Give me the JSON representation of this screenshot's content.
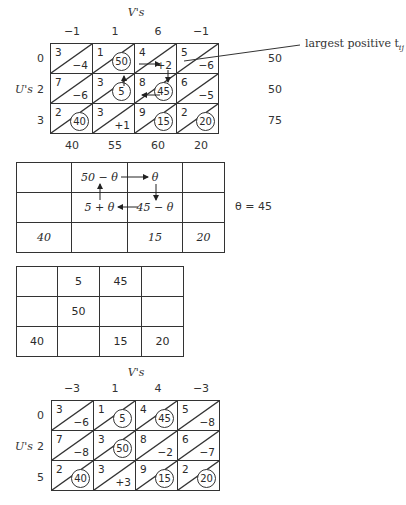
{
  "tableau1": {
    "v_label": "V's",
    "u_label": "U's",
    "v_values": [
      "−1",
      "1",
      "6",
      "−1"
    ],
    "u_values": [
      "0",
      "2",
      "3"
    ],
    "supply": [
      "50",
      "50",
      "75"
    ],
    "demand": [
      "40",
      "55",
      "60",
      "20"
    ],
    "cells": [
      [
        {
          "cost": "3",
          "val": "−4",
          "alloc": false
        },
        {
          "cost": "1",
          "val": "50",
          "alloc": true
        },
        {
          "cost": "4",
          "val": "+2",
          "alloc": false
        },
        {
          "cost": "5",
          "val": "−6",
          "alloc": false
        }
      ],
      [
        {
          "cost": "7",
          "val": "−6",
          "alloc": false
        },
        {
          "cost": "3",
          "val": "5",
          "alloc": true
        },
        {
          "cost": "8",
          "val": "45",
          "alloc": true
        },
        {
          "cost": "6",
          "val": "−5",
          "alloc": false
        }
      ],
      [
        {
          "cost": "2",
          "val": "40",
          "alloc": true
        },
        {
          "cost": "3",
          "val": "+1",
          "alloc": false
        },
        {
          "cost": "9",
          "val": "15",
          "alloc": true
        },
        {
          "cost": "2",
          "val": "20",
          "alloc": true
        }
      ]
    ],
    "annotation": "largest positive t",
    "annotation_sub": "ij"
  },
  "loop_table": {
    "cells": [
      [
        "",
        "50 − θ",
        "θ",
        ""
      ],
      [
        "",
        "5 + θ",
        "45 − θ",
        ""
      ],
      [
        "40",
        "",
        "15",
        "20"
      ]
    ],
    "theta_note": "θ = 45"
  },
  "new_allocation": {
    "cells": [
      [
        "",
        "5",
        "45",
        ""
      ],
      [
        "",
        "50",
        "",
        ""
      ],
      [
        "40",
        "",
        "15",
        "20"
      ]
    ]
  },
  "tableau2": {
    "v_label": "V's",
    "u_label": "U's",
    "v_values": [
      "−3",
      "1",
      "4",
      "−3"
    ],
    "u_values": [
      "0",
      "2",
      "5"
    ],
    "cells": [
      [
        {
          "cost": "3",
          "val": "−6",
          "alloc": false
        },
        {
          "cost": "1",
          "val": "5",
          "alloc": true
        },
        {
          "cost": "4",
          "val": "45",
          "alloc": true
        },
        {
          "cost": "5",
          "val": "−8",
          "alloc": false
        }
      ],
      [
        {
          "cost": "7",
          "val": "−8",
          "alloc": false
        },
        {
          "cost": "3",
          "val": "50",
          "alloc": true
        },
        {
          "cost": "8",
          "val": "−2",
          "alloc": false
        },
        {
          "cost": "6",
          "val": "−7",
          "alloc": false
        }
      ],
      [
        {
          "cost": "2",
          "val": "40",
          "alloc": true
        },
        {
          "cost": "3",
          "val": "+3",
          "alloc": false
        },
        {
          "cost": "9",
          "val": "15",
          "alloc": true
        },
        {
          "cost": "2",
          "val": "20",
          "alloc": true
        }
      ]
    ]
  }
}
